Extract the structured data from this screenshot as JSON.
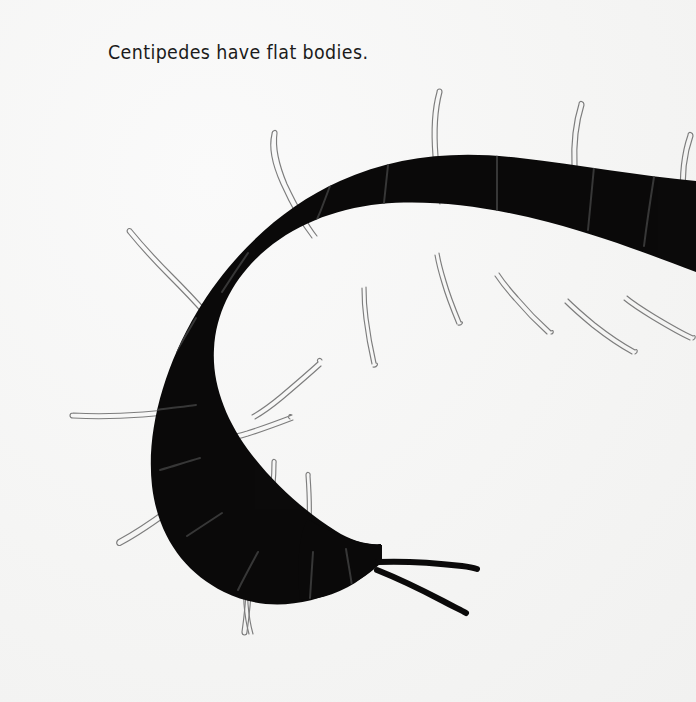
{
  "page": {
    "background_color": "#f6f6f5",
    "width": 696,
    "height": 702
  },
  "caption": {
    "text": "Centipedes have flat bodies.",
    "color": "#1b1b1b"
  },
  "illustration": {
    "subject": "centipede",
    "body_color": "#0b0a0a",
    "segment_line_color": "#3a3a3a",
    "leg_outline_color": "#7d7d7d",
    "antenna_color": "#0b0a0a",
    "description": "Black centipede curled into a C shape, head at lower right with two antennae, pale outlined legs radiating from both sides of the body",
    "leg_count_visible": 18,
    "segment_line_count": 12
  }
}
